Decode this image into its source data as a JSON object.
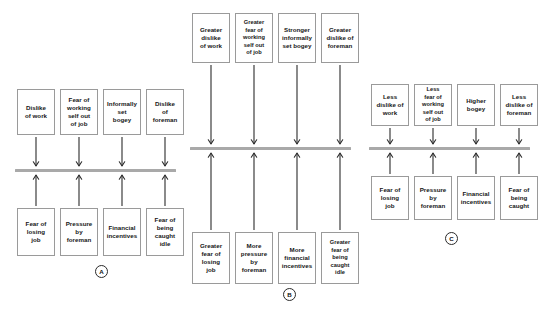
{
  "figure": {
    "type": "diagram",
    "background_color": "#ffffff",
    "box_border_color": "#9a9a9a",
    "bar_color": "#a9a9a9",
    "arrow_color": "#2b2b2b"
  },
  "panels": [
    {
      "id": "A",
      "label": "A",
      "label_x": 95,
      "label_y": 265,
      "bar": {
        "x": 15,
        "y": 169,
        "width": 161
      },
      "top_boxes": [
        {
          "text": "Dislike\nof work",
          "x": 17,
          "y": 89,
          "w": 38,
          "h": 46
        },
        {
          "text": "Fear of\nworking\nself out\nof job",
          "x": 60,
          "y": 89,
          "w": 38,
          "h": 46
        },
        {
          "text": "Informally\nset\nbogey",
          "x": 103,
          "y": 89,
          "w": 38,
          "h": 46
        },
        {
          "text": "Dislike\nof\nforeman",
          "x": 146,
          "y": 89,
          "w": 38,
          "h": 46
        }
      ],
      "bottom_boxes": [
        {
          "text": "Fear of\nlosing\njob",
          "x": 17,
          "y": 208,
          "w": 38,
          "h": 48
        },
        {
          "text": "Pressure\nby\nforeman",
          "x": 60,
          "y": 208,
          "w": 38,
          "h": 48
        },
        {
          "text": "Financial\nincentives",
          "x": 103,
          "y": 208,
          "w": 38,
          "h": 48
        },
        {
          "text": "Fear of\nbeing\ncaught\nidle",
          "x": 146,
          "y": 208,
          "w": 38,
          "h": 48
        }
      ],
      "down_arrows": [
        {
          "x": 36,
          "y1": 137,
          "y2": 166
        },
        {
          "x": 79,
          "y1": 137,
          "y2": 166
        },
        {
          "x": 122,
          "y1": 137,
          "y2": 166
        },
        {
          "x": 165,
          "y1": 137,
          "y2": 166
        }
      ],
      "up_arrows": [
        {
          "x": 36,
          "y1": 206,
          "y2": 175
        },
        {
          "x": 79,
          "y1": 206,
          "y2": 175
        },
        {
          "x": 122,
          "y1": 206,
          "y2": 175
        },
        {
          "x": 165,
          "y1": 206,
          "y2": 175
        }
      ]
    },
    {
      "id": "B",
      "label": "B",
      "label_x": 283,
      "label_y": 288,
      "bar": {
        "x": 190,
        "y": 147,
        "width": 161
      },
      "top_boxes": [
        {
          "text": "Greater\ndislike\nof work",
          "x": 192,
          "y": 13,
          "w": 38,
          "h": 50
        },
        {
          "text": "Greater\nfear of\nworking\nself out\nof job",
          "x": 235,
          "y": 13,
          "w": 38,
          "h": 50
        },
        {
          "text": "Stronger\ninformally\nset bogey",
          "x": 278,
          "y": 13,
          "w": 38,
          "h": 50
        },
        {
          "text": "Greater\ndislike of\nforeman",
          "x": 321,
          "y": 13,
          "w": 38,
          "h": 50
        }
      ],
      "bottom_boxes": [
        {
          "text": "Greater\nfear of\nlosing\njob",
          "x": 192,
          "y": 232,
          "w": 38,
          "h": 52
        },
        {
          "text": "More\npressure\nby\nforeman",
          "x": 235,
          "y": 232,
          "w": 38,
          "h": 52
        },
        {
          "text": "More\nfinancial\nincentives",
          "x": 278,
          "y": 232,
          "w": 38,
          "h": 52
        },
        {
          "text": "Greater\nfear of\nbeing\ncaught\nidle",
          "x": 321,
          "y": 232,
          "w": 38,
          "h": 52
        }
      ],
      "down_arrows": [
        {
          "x": 211,
          "y1": 65,
          "y2": 144
        },
        {
          "x": 254,
          "y1": 65,
          "y2": 144
        },
        {
          "x": 297,
          "y1": 65,
          "y2": 144
        },
        {
          "x": 340,
          "y1": 65,
          "y2": 144
        }
      ],
      "up_arrows": [
        {
          "x": 211,
          "y1": 230,
          "y2": 153
        },
        {
          "x": 254,
          "y1": 230,
          "y2": 153
        },
        {
          "x": 297,
          "y1": 230,
          "y2": 153
        },
        {
          "x": 340,
          "y1": 230,
          "y2": 153
        }
      ]
    },
    {
      "id": "C",
      "label": "C",
      "label_x": 445,
      "label_y": 232,
      "bar": {
        "x": 369,
        "y": 147,
        "width": 161
      },
      "top_boxes": [
        {
          "text": "Less\ndislike of\nwork",
          "x": 371,
          "y": 84,
          "w": 38,
          "h": 42
        },
        {
          "text": "Less\nfear of\nworking\nself out\nof job",
          "x": 414,
          "y": 84,
          "w": 38,
          "h": 42
        },
        {
          "text": "Higher\nbogey",
          "x": 457,
          "y": 84,
          "w": 38,
          "h": 42
        },
        {
          "text": "Less\ndislike of\nforeman",
          "x": 500,
          "y": 84,
          "w": 38,
          "h": 42
        }
      ],
      "bottom_boxes": [
        {
          "text": "Fear of\nlosing\njob",
          "x": 371,
          "y": 176,
          "w": 38,
          "h": 44
        },
        {
          "text": "Pressure\nby\nforeman",
          "x": 414,
          "y": 176,
          "w": 38,
          "h": 44
        },
        {
          "text": "Financial\nincentives",
          "x": 457,
          "y": 176,
          "w": 38,
          "h": 44
        },
        {
          "text": "Fear of\nbeing\ncaught",
          "x": 500,
          "y": 176,
          "w": 38,
          "h": 44
        }
      ],
      "down_arrows": [
        {
          "x": 390,
          "y1": 128,
          "y2": 144
        },
        {
          "x": 433,
          "y1": 128,
          "y2": 144
        },
        {
          "x": 476,
          "y1": 128,
          "y2": 144
        },
        {
          "x": 519,
          "y1": 128,
          "y2": 144
        }
      ],
      "up_arrows": [
        {
          "x": 390,
          "y1": 174,
          "y2": 153
        },
        {
          "x": 433,
          "y1": 174,
          "y2": 153
        },
        {
          "x": 476,
          "y1": 174,
          "y2": 153
        },
        {
          "x": 519,
          "y1": 174,
          "y2": 153
        }
      ]
    }
  ]
}
